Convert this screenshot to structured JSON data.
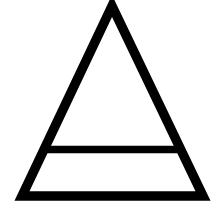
{
  "symbol": {
    "name": "air-earth-triangle-symbol",
    "stroke_color": "#000000",
    "background_color": "#ffffff",
    "stroke_width": 9.5,
    "apex": [
      112,
      6
    ],
    "bottom_left": [
      22,
      196
    ],
    "bottom_right": [
      203,
      196
    ],
    "crossbar_y": 149.5,
    "crossbar_left_x": 44,
    "crossbar_right_x": 180
  }
}
